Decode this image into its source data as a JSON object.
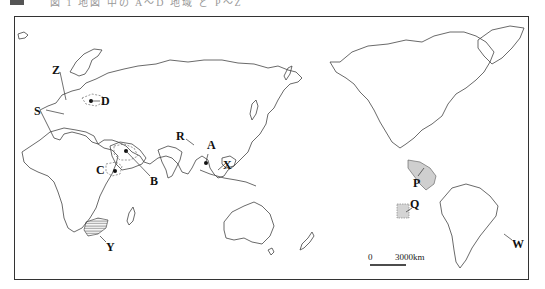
{
  "caption": {
    "text": "図 1  地図 中の A〜D 地域 と P〜Z"
  },
  "map": {
    "projection": "world map, Pacific-centered",
    "labels": [
      {
        "id": "Z",
        "text": "Z"
      },
      {
        "id": "S",
        "text": "S"
      },
      {
        "id": "D",
        "text": "D"
      },
      {
        "id": "B",
        "text": "B"
      },
      {
        "id": "C",
        "text": "C"
      },
      {
        "id": "R",
        "text": "R"
      },
      {
        "id": "A",
        "text": "A"
      },
      {
        "id": "X",
        "text": "X"
      },
      {
        "id": "Y",
        "text": "Y"
      },
      {
        "id": "P",
        "text": "P"
      },
      {
        "id": "Q",
        "text": "Q"
      },
      {
        "id": "W",
        "text": "W"
      }
    ],
    "highlight_color": "#cfcfcf",
    "line_color": "#444444"
  },
  "scale_bar": {
    "zero": "0",
    "distance": "3000km"
  }
}
